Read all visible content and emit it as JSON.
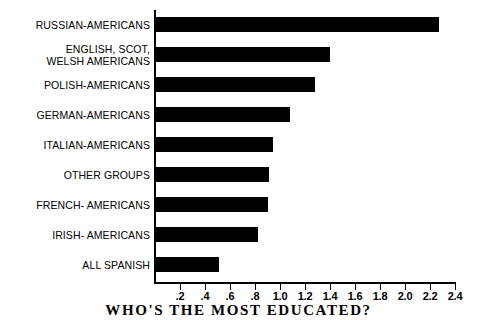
{
  "chart_data": {
    "type": "bar",
    "orientation": "horizontal",
    "title": "WHO'S THE MOST EDUCATED?",
    "xlabel": "",
    "ylabel": "",
    "xlim": [
      0,
      2.4
    ],
    "grid": false,
    "legend": false,
    "categories": [
      "RUSSIAN-AMERICANS",
      "ENGLISH, SCOT,\n  WELSH AMERICANS",
      "POLISH-AMERICANS",
      "GERMAN-AMERICANS",
      "ITALIAN-AMERICANS",
      "OTHER GROUPS",
      "FRENCH- AMERICANS",
      "IRISH- AMERICANS",
      "ALL SPANISH"
    ],
    "values": [
      2.27,
      1.4,
      1.28,
      1.08,
      0.94,
      0.91,
      0.9,
      0.82,
      0.51
    ],
    "xticks": [
      0.2,
      0.4,
      0.6,
      0.8,
      1.0,
      1.2,
      1.4,
      1.6,
      1.8,
      2.0,
      2.2,
      2.4
    ],
    "xtick_labels": [
      ".2",
      ".4",
      ".6",
      ".8",
      "1.0",
      "1.2",
      "1.4",
      "1.6",
      "1.8",
      "2.0",
      "2.2",
      "2.4"
    ],
    "bar_color": "#000000",
    "background_color": "#ffffff"
  }
}
